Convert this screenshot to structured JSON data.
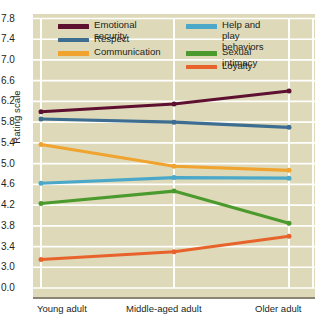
{
  "chart_data": {
    "type": "line",
    "title": "",
    "xlabel": "",
    "ylabel": "Rating scale",
    "categories": [
      "Young adult",
      "Middle-aged adult",
      "Older adult"
    ],
    "ytick_labels": [
      "7.8",
      "7.4",
      "7.0",
      "6.6",
      "6.2",
      "5.8",
      "5.4",
      "5.0",
      "4.6",
      "4.2",
      "3.8",
      "3.4",
      "3.0",
      "0.0"
    ],
    "ytick_values": [
      7.8,
      7.4,
      7.0,
      6.6,
      6.2,
      5.8,
      5.4,
      5.0,
      4.6,
      4.2,
      3.8,
      3.4,
      3.0,
      0.0
    ],
    "axis_note": "y-axis is broken between 3.0 and 0.0",
    "ylim": [
      0.0,
      7.8
    ],
    "grid": "horizontal-and-vertical",
    "legend_position": "top-inside",
    "plot_background": "#ded9b8",
    "gridline_color": "#ffffff",
    "series": [
      {
        "name": "Emotional security",
        "color": "#5d1030",
        "values": [
          6.0,
          6.15,
          6.4
        ]
      },
      {
        "name": "Respect",
        "color": "#3d6e91",
        "values": [
          5.86,
          5.8,
          5.7
        ]
      },
      {
        "name": "Communication",
        "color": "#f0a32e",
        "values": [
          5.37,
          4.95,
          4.87
        ]
      },
      {
        "name": "Help and play behaviors",
        "color": "#4ba8c9",
        "values": [
          4.62,
          4.73,
          4.72
        ]
      },
      {
        "name": "Sexual intimacy",
        "color": "#4a9a2d",
        "values": [
          4.23,
          4.47,
          3.85
        ]
      },
      {
        "name": "Loyalty",
        "color": "#e8632b",
        "values": [
          3.15,
          3.3,
          3.6
        ]
      }
    ]
  },
  "legend": {
    "items": [
      {
        "label": "Emotional security",
        "color": "#5d1030",
        "col": 0,
        "row": 0
      },
      {
        "label": "Respect",
        "color": "#3d6e91",
        "col": 0,
        "row": 1
      },
      {
        "label": "Communication",
        "color": "#f0a32e",
        "col": 0,
        "row": 2
      },
      {
        "label": "Help and play\nbehaviors",
        "color": "#4ba8c9",
        "col": 1,
        "row": 0
      },
      {
        "label": "Sexual intimacy",
        "color": "#4a9a2d",
        "col": 1,
        "row": 2
      },
      {
        "label": "Loyalty",
        "color": "#e8632b",
        "col": 1,
        "row": 3
      }
    ]
  }
}
